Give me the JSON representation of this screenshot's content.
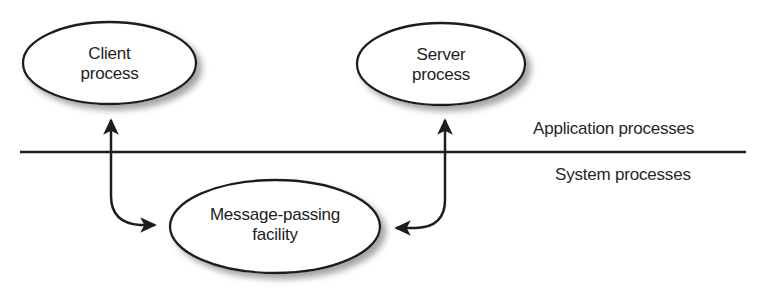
{
  "diagram": {
    "colors": {
      "stroke": "#1d1d1d",
      "fill": "#ffffff",
      "shadow": "#a8a8a8",
      "text": "#1d1d1d",
      "background": "#ffffff"
    },
    "nodes": [
      {
        "id": "client-process",
        "label_line1": "Client",
        "label_line2": "process",
        "shape": "ellipse",
        "cx": 109.5,
        "cy": 63,
        "rx": 86.5,
        "ry": 41
      },
      {
        "id": "server-process",
        "label_line1": "Server",
        "label_line2": "process",
        "shape": "ellipse",
        "cx": 441,
        "cy": 64,
        "rx": 84,
        "ry": 41
      },
      {
        "id": "message-passing-facility",
        "label_line1": "Message-passing",
        "label_line2": "facility",
        "shape": "ellipse",
        "cx": 275,
        "cy": 226.5,
        "rx": 105,
        "ry": 46.5
      }
    ],
    "divider": {
      "id": "layer-divider",
      "x1": 20,
      "x2": 746,
      "y": 152
    },
    "layer_labels": {
      "above": "Application processes",
      "below": "System processes"
    },
    "connectors": [
      {
        "id": "client-to-facility",
        "from": "message-passing-facility",
        "to": "client-process",
        "arrowheads": [
          "up-into-client",
          "right-into-facility"
        ]
      },
      {
        "id": "server-to-facility",
        "from": "message-passing-facility",
        "to": "server-process",
        "arrowheads": [
          "up-into-server",
          "left-into-facility"
        ]
      }
    ]
  }
}
